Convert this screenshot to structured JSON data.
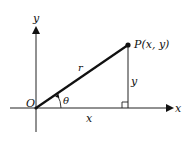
{
  "diagram": {
    "labels": {
      "y_axis": "y",
      "x_axis": "x",
      "origin": "O",
      "point": "P(x, y)",
      "radius": "r",
      "angle": "θ",
      "horizontal_leg": "x",
      "vertical_leg": "y"
    },
    "colors": {
      "stroke": "#111111",
      "background": "#ffffff"
    }
  }
}
